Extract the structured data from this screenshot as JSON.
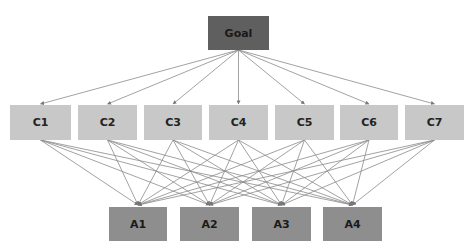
{
  "diagram": {
    "type": "AHP hierarchy",
    "colors": {
      "goal": "#5f5f5f",
      "criteria": "#c8c8c8",
      "alternatives": "#8e8e8e",
      "edges": "#8a8a8a"
    },
    "goal": {
      "label": "Goal",
      "x": 208,
      "y": 16,
      "w": 61,
      "h": 34
    },
    "criteria": [
      {
        "label": "C1",
        "x": 10,
        "y": 105,
        "w": 61,
        "h": 35
      },
      {
        "label": "C2",
        "x": 78,
        "y": 105,
        "w": 59,
        "h": 35
      },
      {
        "label": "C3",
        "x": 144,
        "y": 105,
        "w": 58,
        "h": 35
      },
      {
        "label": "C4",
        "x": 209,
        "y": 105,
        "w": 59,
        "h": 35
      },
      {
        "label": "C5",
        "x": 275,
        "y": 105,
        "w": 59,
        "h": 35
      },
      {
        "label": "C6",
        "x": 340,
        "y": 105,
        "w": 58,
        "h": 35
      },
      {
        "label": "C7",
        "x": 405,
        "y": 105,
        "w": 59,
        "h": 35
      }
    ],
    "alternatives": [
      {
        "label": "A1",
        "x": 109,
        "y": 207,
        "w": 58,
        "h": 34
      },
      {
        "label": "A2",
        "x": 180,
        "y": 207,
        "w": 59,
        "h": 34
      },
      {
        "label": "A3",
        "x": 252,
        "y": 207,
        "w": 59,
        "h": 34
      },
      {
        "label": "A4",
        "x": 323,
        "y": 207,
        "w": 59,
        "h": 34
      }
    ]
  }
}
